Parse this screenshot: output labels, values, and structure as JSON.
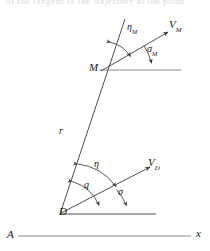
{
  "figure": {
    "caption_clipped": "of the tangent to the trajectory at the point",
    "background_color": "#ffffff",
    "line_color": "#3c3c42",
    "axis_color": "#8a8a90",
    "text_color": "#17171a",
    "points": [
      {
        "id": "D",
        "label": "D",
        "x": 62,
        "y": 212,
        "role": "origin-gun-position"
      },
      {
        "id": "M",
        "label": "M",
        "x": 92,
        "y": 68,
        "role": "target-point"
      },
      {
        "id": "A",
        "label": "A",
        "x": 10,
        "y": 235,
        "role": "axis-origin-label"
      }
    ],
    "axis": {
      "label": "x",
      "label_x": 197,
      "label_y": 232,
      "start_x": 18,
      "start_y": 236,
      "end_x": 191,
      "end_y": 236
    },
    "segments": [
      {
        "name": "range-line-r",
        "x1": 60,
        "y1": 214,
        "x2": 125,
        "y2": 19
      },
      {
        "name": "velocity-vector-D",
        "x1": 61,
        "y1": 213,
        "x2": 152,
        "y2": 166
      },
      {
        "name": "velocity-vector-M",
        "x1": 101,
        "y1": 71,
        "x2": 170,
        "y2": 31
      },
      {
        "name": "horizontal-through-D",
        "x1": 61,
        "y1": 214,
        "x2": 156,
        "y2": 214
      },
      {
        "name": "horizontal-through-M",
        "x1": 99,
        "y1": 70,
        "x2": 181,
        "y2": 70
      },
      {
        "name": "horizontal-axis-A-x",
        "x1": 18,
        "y1": 236,
        "x2": 191,
        "y2": 236
      }
    ],
    "labels": [
      {
        "id": "eta-M",
        "base": "η",
        "sub": "M",
        "x": 128,
        "y": 23,
        "kind": "angle"
      },
      {
        "id": "V-M",
        "base": "V",
        "sub": "M",
        "x": 170,
        "y": 20,
        "kind": "vector"
      },
      {
        "id": "sigma-M",
        "base": "σ",
        "sub": "M",
        "x": 148,
        "y": 45,
        "kind": "angle"
      },
      {
        "id": "r",
        "base": "r",
        "sub": "",
        "x": 60,
        "y": 127,
        "kind": "length"
      },
      {
        "id": "eta",
        "base": "η",
        "sub": "",
        "x": 95,
        "y": 161,
        "kind": "angle"
      },
      {
        "id": "V-D",
        "base": "V",
        "sub": "D",
        "x": 149,
        "y": 158,
        "kind": "vector"
      },
      {
        "id": "q",
        "base": "q",
        "sub": "",
        "x": 85,
        "y": 181,
        "kind": "angle"
      },
      {
        "id": "sigma",
        "base": "σ",
        "sub": "",
        "x": 119,
        "y": 188,
        "kind": "angle"
      }
    ],
    "arcs": [
      {
        "name": "arc-eta-M",
        "note": "between range line and V_M at M"
      },
      {
        "name": "arc-sigma-M",
        "note": "between V_M and horizontal at M"
      },
      {
        "name": "arc-eta",
        "note": "between range line and V_D at D"
      },
      {
        "name": "arc-q",
        "note": "between range line and horizontal at D"
      },
      {
        "name": "arc-sigma",
        "note": "between V_D and horizontal at D"
      }
    ]
  }
}
